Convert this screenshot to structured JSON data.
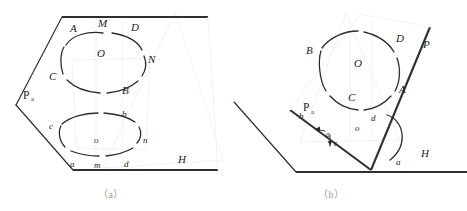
{
  "figure": {
    "captions": {
      "a": "（a）",
      "b": "（b）"
    },
    "colors": {
      "line": "#2b2b2b",
      "thick_line": "#303030",
      "caption": "#9a9a9a",
      "background": "#ffffff",
      "ghost": "#f2f2f2"
    }
  },
  "panel_a": {
    "name": "a",
    "plane_labels": {
      "inclined_plane": "P",
      "inclined_plane_subscript": "a",
      "ground_plane": "H"
    },
    "upper_ellipse": {
      "name": "circle-ABCD",
      "center_label": "O",
      "points": [
        {
          "id": "A",
          "label": "A"
        },
        {
          "id": "M",
          "label": "M"
        },
        {
          "id": "D",
          "label": "D"
        },
        {
          "id": "N",
          "label": "N"
        },
        {
          "id": "B",
          "label": "B"
        },
        {
          "id": "C",
          "label": "C"
        }
      ]
    },
    "lower_ellipse": {
      "name": "projection-abcd",
      "center_label": "o",
      "points": [
        {
          "id": "c",
          "label": "c"
        },
        {
          "id": "b",
          "label": "b"
        },
        {
          "id": "n",
          "label": "n"
        },
        {
          "id": "d",
          "label": "d"
        },
        {
          "id": "m",
          "label": "m"
        },
        {
          "id": "a",
          "label": "a"
        }
      ]
    }
  },
  "panel_b": {
    "name": "b",
    "plane_labels": {
      "inclined_plane": "P",
      "trace_plane": "P",
      "trace_plane_subscript": "a",
      "ground_plane": "H"
    },
    "angle": {
      "label": "a",
      "name": "dihedral-angle-alpha"
    },
    "circle": {
      "name": "circle-ABCD",
      "center_label": "O",
      "points": [
        {
          "id": "B",
          "label": "B"
        },
        {
          "id": "D",
          "label": "D"
        },
        {
          "id": "A",
          "label": "A"
        },
        {
          "id": "C",
          "label": "C"
        }
      ]
    },
    "projection": {
      "name": "projection-abcd",
      "center_label": "o",
      "points": [
        {
          "id": "b",
          "label": "b"
        },
        {
          "id": "d",
          "label": "d"
        },
        {
          "id": "a",
          "label": "a"
        },
        {
          "id": "c",
          "label": "c"
        }
      ]
    },
    "arrows": [
      {
        "id": "arrow-a",
        "label": "a",
        "direction": "left"
      },
      {
        "id": "arrow-c",
        "label": "c",
        "direction": "down"
      }
    ]
  }
}
